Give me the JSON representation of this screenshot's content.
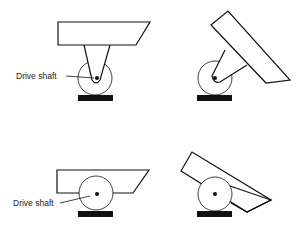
{
  "diagram": {
    "panels": [
      {
        "id": "top-left",
        "label": "Drive shaft",
        "description": "Upright caster: platform above, fork down to wheel, drive shaft at wheel center"
      },
      {
        "id": "top-right",
        "description": "Caster with tilted platform swung to the right"
      },
      {
        "id": "bottom-left",
        "label": "Drive shaft",
        "description": "Low platform sitting over the wheel with drive shaft at center"
      },
      {
        "id": "bottom-right",
        "description": "Tilted platform resting on wheel"
      }
    ],
    "labels": {
      "drive_shaft_top": "Drive shaft",
      "drive_shaft_bottom": "Drive shaft"
    },
    "colors": {
      "stroke": "#111111",
      "ground": "#111111",
      "background": "#ffffff"
    }
  }
}
